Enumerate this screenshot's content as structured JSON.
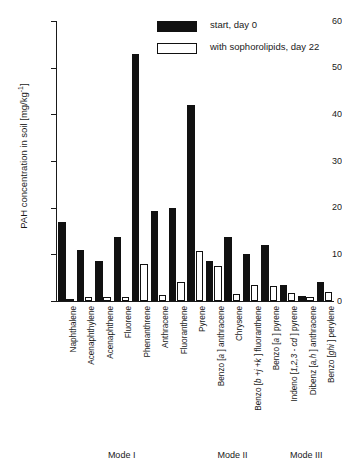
{
  "chart_data": {
    "type": "bar",
    "title": "",
    "xlabel": "",
    "ylabel": "PAH concentration in soil  [mg/kg",
    "ylabel_sup": "-1",
    "ylabel_suffix": "]",
    "ylim": [
      0,
      60
    ],
    "ytick_step": 10,
    "yticks": [
      "0",
      "10",
      "20",
      "30",
      "40",
      "50",
      "60"
    ],
    "grid": false,
    "legend_position": "top-right",
    "categories": [
      "Naphthalene",
      "Acenaphthylene",
      "Acenaphthene",
      "Fluorene",
      "Phenanthrene",
      "Anthracene",
      "Fluoranthene",
      "Pyrene",
      "Benzo [a ] anthracene",
      "Chrysene",
      "Benzo [b +j +k ] fluoranthene",
      "Benzo [a ] pyrene",
      "Indeno [1,2,3 - cd ] pyrene",
      "Dibenz [a,h ] anthracene",
      "Benzo [ghi ] perylene"
    ],
    "series": [
      {
        "name": "start, day 0",
        "color": "#111111",
        "values": [
          17.0,
          11.0,
          8.5,
          13.8,
          53.0,
          19.2,
          20.0,
          42.0,
          8.5,
          13.7,
          10.0,
          12.0,
          3.5,
          1.0,
          4.0
        ]
      },
      {
        "name": "with sophorolipids, day 22",
        "color": "#ffffff",
        "values": [
          0.5,
          0.8,
          0.8,
          0.8,
          8.0,
          1.2,
          4.0,
          10.8,
          7.5,
          1.5,
          3.5,
          3.3,
          1.8,
          0.8,
          1.9
        ]
      }
    ],
    "annotations": [
      {
        "label": "Mode I",
        "span": [
          0,
          7
        ]
      },
      {
        "label": "Mode II",
        "span": [
          7,
          12
        ]
      },
      {
        "label": "Mode III",
        "span": [
          12,
          15
        ]
      }
    ]
  },
  "legend": {
    "items": [
      {
        "label": "start, day 0",
        "swatch": "filled-black"
      },
      {
        "label": "with sophorolipids, day 22",
        "swatch": "outlined-white"
      }
    ]
  }
}
